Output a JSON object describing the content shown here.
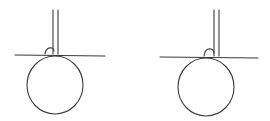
{
  "diagram": {
    "stroke_color": "#3a3a3a",
    "background": "#ffffff",
    "figures": [
      {
        "id": "left",
        "rod": {
          "x1": 53,
          "x2": 58,
          "y_top": 10,
          "y_bottom": 54
        },
        "tangent_line": {
          "x1": 15,
          "x2": 105,
          "y1": 55,
          "y2": 56
        },
        "circle": {
          "cx": 55,
          "cy": 85,
          "rx": 28,
          "ry": 29
        },
        "angle_arc": {
          "d": "M45 54 Q46 47 52 48 Q54 49 54 51"
        }
      },
      {
        "id": "right",
        "rod": {
          "x1": 214,
          "x2": 219,
          "y_top": 10,
          "y_bottom": 56
        },
        "tangent_line": {
          "x1": 160,
          "x2": 258,
          "y1": 57,
          "y2": 58
        },
        "circle": {
          "cx": 206,
          "cy": 87,
          "rx": 28,
          "ry": 29
        },
        "angle_arc": {
          "d": "M204 56 Q205 48 211 49 Q214 50 214 53"
        }
      }
    ]
  }
}
